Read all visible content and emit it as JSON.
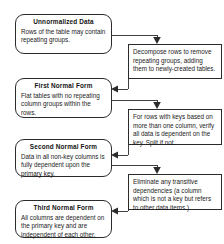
{
  "diagram": {
    "type": "flowchart",
    "stroke_color": "#2b2b2b",
    "text_color": "#1a1a1a",
    "background_color": "#ffffff",
    "stages": [
      {
        "id": "unnormalized-data",
        "title": "Unnormalized Data",
        "body": "Rows of the table may contain repeating groups."
      },
      {
        "id": "first-normal-form",
        "title": "First Normal Form",
        "body": "Flat tables with no repeating column groups within the rows."
      },
      {
        "id": "second-normal-form",
        "title": "Second Normal Form",
        "body": "Data in all non-key columns is fully dependent upon the primary key."
      },
      {
        "id": "third-normal-form",
        "title": "Third Normal Form",
        "body": "All columns are dependent on the primary key and are independent of each other."
      }
    ],
    "actions": [
      {
        "id": "decompose-rows",
        "body": "Decompose rows to remove repeating groups, adding them to newly-created tables."
      },
      {
        "id": "verify-key-dependency",
        "body": "For rows with keys based on more than one column, verify all data is dependent on the key. Split if not."
      },
      {
        "id": "eliminate-transitive-dependencies",
        "body": "Eliminate any transitive dependencies (a column which is not a key but refers to other data items.)"
      }
    ],
    "connectors": [
      {
        "id": "connector-unf-to-decompose",
        "from": "unnormalized-data",
        "to": "decompose-rows",
        "arrow": "down"
      },
      {
        "id": "connector-decompose-to-1nf",
        "from": "decompose-rows",
        "to": "first-normal-form",
        "arrow": "left"
      },
      {
        "id": "connector-1nf-to-verify",
        "from": "first-normal-form",
        "to": "verify-key-dependency",
        "arrow": "down"
      },
      {
        "id": "connector-verify-to-2nf",
        "from": "verify-key-dependency",
        "to": "second-normal-form",
        "arrow": "left"
      },
      {
        "id": "connector-2nf-to-eliminate",
        "from": "second-normal-form",
        "to": "eliminate-transitive-dependencies",
        "arrow": "down"
      },
      {
        "id": "connector-eliminate-to-3nf",
        "from": "eliminate-transitive-dependencies",
        "to": "third-normal-form",
        "arrow": "left"
      }
    ]
  }
}
